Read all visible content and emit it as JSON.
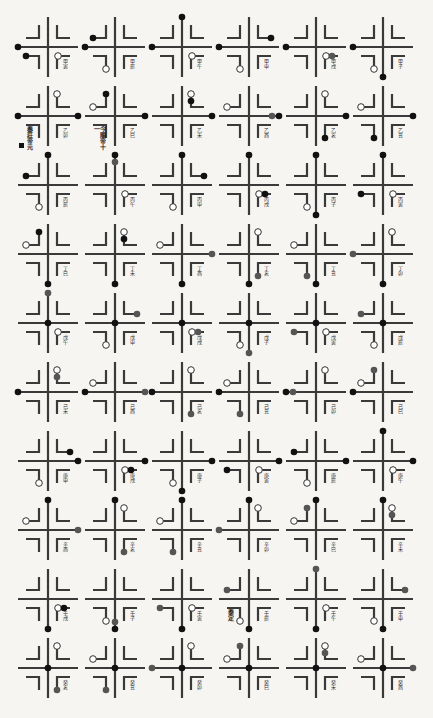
{
  "diagram": {
    "type": "yin-yang cross-and-bracket divination chart",
    "rows": 10,
    "cols": 6,
    "origin": {
      "x": 48,
      "y": 47
    },
    "pitch": {
      "x": 67,
      "y": 69
    },
    "colors": {
      "background": "#f6f5f1",
      "line": "#3a3a3a",
      "dot_filled": "#111111",
      "dot_gray": "#555555",
      "dot_open_fill": "#ffffff",
      "dot_open_stroke": "#333333"
    },
    "legend": {
      "dot_types": {
        "f": "filled black",
        "g": "filled gray",
        "o": "open circle"
      },
      "positions": [
        "N",
        "S",
        "E",
        "W",
        "C",
        "NWh",
        "NWv",
        "NEh",
        "NEv",
        "SWh",
        "SWv",
        "SEh",
        "SEv"
      ]
    },
    "cells": [
      {
        "r": 0,
        "c": 0,
        "label": "甲寅",
        "dots": [
          {
            "p": "W",
            "t": "f"
          },
          {
            "p": "SWh",
            "t": "f"
          },
          {
            "p": "SEh",
            "t": "o"
          }
        ]
      },
      {
        "r": 0,
        "c": 1,
        "label": "甲辰",
        "dots": [
          {
            "p": "W",
            "t": "f"
          },
          {
            "p": "NWh",
            "t": "f"
          },
          {
            "p": "SWv",
            "t": "o"
          }
        ]
      },
      {
        "r": 0,
        "c": 2,
        "label": "甲午",
        "dots": [
          {
            "p": "N",
            "t": "f"
          },
          {
            "p": "W",
            "t": "f"
          },
          {
            "p": "SEh",
            "t": "o"
          }
        ]
      },
      {
        "r": 0,
        "c": 3,
        "label": "甲申",
        "dots": [
          {
            "p": "W",
            "t": "f"
          },
          {
            "p": "NEh",
            "t": "f"
          },
          {
            "p": "SWv",
            "t": "o"
          }
        ]
      },
      {
        "r": 0,
        "c": 4,
        "label": "甲戌",
        "dots": [
          {
            "p": "W",
            "t": "f"
          },
          {
            "p": "SEh",
            "t": "o"
          },
          {
            "p": "SEh2",
            "t": "g"
          }
        ]
      },
      {
        "r": 0,
        "c": 5,
        "label": "甲子",
        "dots": [
          {
            "p": "W",
            "t": "f"
          },
          {
            "p": "S",
            "t": "f"
          },
          {
            "p": "SWv",
            "t": "o"
          }
        ]
      },
      {
        "r": 1,
        "c": 0,
        "label": "乙卯",
        "dots": [
          {
            "p": "W",
            "t": "f"
          },
          {
            "p": "E",
            "t": "f"
          },
          {
            "p": "NEv",
            "t": "o"
          }
        ],
        "note": "秦莊帝元",
        "note_mark": true
      },
      {
        "r": 1,
        "c": 1,
        "label": "乙巳",
        "dots": [
          {
            "p": "E",
            "t": "f"
          },
          {
            "p": "NWh",
            "t": "o"
          },
          {
            "p": "NWv",
            "t": "f"
          }
        ],
        "note": "今順帝十一"
      },
      {
        "r": 1,
        "c": 2,
        "label": "乙未",
        "dots": [
          {
            "p": "E",
            "t": "f"
          },
          {
            "p": "NEv",
            "t": "o"
          },
          {
            "p": "NEv2",
            "t": "f"
          }
        ]
      },
      {
        "r": 1,
        "c": 3,
        "label": "乙酉",
        "dots": [
          {
            "p": "E",
            "t": "f"
          },
          {
            "p": "E2",
            "t": "g"
          },
          {
            "p": "NWh",
            "t": "o"
          }
        ]
      },
      {
        "r": 1,
        "c": 4,
        "label": "乙亥",
        "dots": [
          {
            "p": "E",
            "t": "f"
          },
          {
            "p": "NEv",
            "t": "o"
          },
          {
            "p": "SEv",
            "t": "f"
          }
        ]
      },
      {
        "r": 1,
        "c": 5,
        "label": "乙丑",
        "dots": [
          {
            "p": "E",
            "t": "f"
          },
          {
            "p": "NWh",
            "t": "o"
          },
          {
            "p": "SWv",
            "t": "f"
          }
        ]
      },
      {
        "r": 2,
        "c": 0,
        "label": "丙辰",
        "dots": [
          {
            "p": "N",
            "t": "f"
          },
          {
            "p": "NWh",
            "t": "f"
          },
          {
            "p": "SWv",
            "t": "o"
          }
        ]
      },
      {
        "r": 2,
        "c": 1,
        "label": "丙午",
        "dots": [
          {
            "p": "N",
            "t": "f"
          },
          {
            "p": "N2",
            "t": "g"
          },
          {
            "p": "SEh",
            "t": "o"
          }
        ]
      },
      {
        "r": 2,
        "c": 2,
        "label": "丙申",
        "dots": [
          {
            "p": "N",
            "t": "f"
          },
          {
            "p": "NEh",
            "t": "f"
          },
          {
            "p": "SWv",
            "t": "o"
          }
        ]
      },
      {
        "r": 2,
        "c": 3,
        "label": "丙戌",
        "dots": [
          {
            "p": "N",
            "t": "f"
          },
          {
            "p": "SEh",
            "t": "o"
          },
          {
            "p": "SEh2",
            "t": "f"
          }
        ]
      },
      {
        "r": 2,
        "c": 4,
        "label": "丙子",
        "dots": [
          {
            "p": "N",
            "t": "f"
          },
          {
            "p": "S",
            "t": "f"
          },
          {
            "p": "SWv",
            "t": "o"
          }
        ]
      },
      {
        "r": 2,
        "c": 5,
        "label": "丙寅",
        "dots": [
          {
            "p": "N",
            "t": "f"
          },
          {
            "p": "SWh",
            "t": "f"
          },
          {
            "p": "SEh",
            "t": "o"
          }
        ]
      },
      {
        "r": 3,
        "c": 0,
        "label": "丁巳",
        "dots": [
          {
            "p": "S",
            "t": "f"
          },
          {
            "p": "NWh",
            "t": "o"
          },
          {
            "p": "NWv",
            "t": "f"
          }
        ]
      },
      {
        "r": 3,
        "c": 1,
        "label": "丁未",
        "dots": [
          {
            "p": "S",
            "t": "f"
          },
          {
            "p": "NEv",
            "t": "o"
          },
          {
            "p": "NEv2",
            "t": "f"
          }
        ]
      },
      {
        "r": 3,
        "c": 2,
        "label": "丁酉",
        "dots": [
          {
            "p": "S",
            "t": "f"
          },
          {
            "p": "E",
            "t": "g"
          },
          {
            "p": "NWh",
            "t": "o"
          }
        ]
      },
      {
        "r": 3,
        "c": 3,
        "label": "丁亥",
        "dots": [
          {
            "p": "S",
            "t": "f"
          },
          {
            "p": "NEv",
            "t": "o"
          },
          {
            "p": "SEv",
            "t": "g"
          }
        ]
      },
      {
        "r": 3,
        "c": 4,
        "label": "丁丑",
        "dots": [
          {
            "p": "S",
            "t": "f"
          },
          {
            "p": "NWh",
            "t": "o"
          },
          {
            "p": "SWv",
            "t": "g"
          }
        ]
      },
      {
        "r": 3,
        "c": 5,
        "label": "丁卯",
        "dots": [
          {
            "p": "S",
            "t": "f"
          },
          {
            "p": "W",
            "t": "g"
          },
          {
            "p": "NEv",
            "t": "o"
          }
        ]
      },
      {
        "r": 4,
        "c": 0,
        "label": "戊午",
        "dots": [
          {
            "p": "C",
            "t": "f"
          },
          {
            "p": "N",
            "t": "g"
          },
          {
            "p": "SEh",
            "t": "o"
          }
        ]
      },
      {
        "r": 4,
        "c": 1,
        "label": "戊申",
        "dots": [
          {
            "p": "C",
            "t": "f"
          },
          {
            "p": "NEh",
            "t": "g"
          },
          {
            "p": "SWv",
            "t": "o"
          }
        ]
      },
      {
        "r": 4,
        "c": 2,
        "label": "戊戌",
        "dots": [
          {
            "p": "C",
            "t": "f"
          },
          {
            "p": "SEh",
            "t": "o"
          },
          {
            "p": "SEh2",
            "t": "g"
          }
        ]
      },
      {
        "r": 4,
        "c": 3,
        "label": "戊子",
        "dots": [
          {
            "p": "C",
            "t": "f"
          },
          {
            "p": "S",
            "t": "g"
          },
          {
            "p": "SWv",
            "t": "o"
          }
        ]
      },
      {
        "r": 4,
        "c": 4,
        "label": "戊寅",
        "dots": [
          {
            "p": "C",
            "t": "f"
          },
          {
            "p": "SWh",
            "t": "g"
          },
          {
            "p": "SEh",
            "t": "o"
          }
        ]
      },
      {
        "r": 4,
        "c": 5,
        "label": "戊辰",
        "dots": [
          {
            "p": "C",
            "t": "f"
          },
          {
            "p": "NWh",
            "t": "g"
          },
          {
            "p": "SWv",
            "t": "o"
          }
        ]
      },
      {
        "r": 5,
        "c": 0,
        "label": "己未",
        "dots": [
          {
            "p": "W",
            "t": "f"
          },
          {
            "p": "NEv",
            "t": "o"
          },
          {
            "p": "NEv2",
            "t": "g"
          }
        ]
      },
      {
        "r": 5,
        "c": 1,
        "label": "己酉",
        "dots": [
          {
            "p": "W",
            "t": "f"
          },
          {
            "p": "E",
            "t": "g"
          },
          {
            "p": "NWh",
            "t": "o"
          }
        ]
      },
      {
        "r": 5,
        "c": 2,
        "label": "己亥",
        "dots": [
          {
            "p": "W",
            "t": "f"
          },
          {
            "p": "NEv",
            "t": "o"
          },
          {
            "p": "SEv",
            "t": "g"
          }
        ]
      },
      {
        "r": 5,
        "c": 3,
        "label": "己丑",
        "dots": [
          {
            "p": "W",
            "t": "f"
          },
          {
            "p": "NWh",
            "t": "o"
          },
          {
            "p": "SWv",
            "t": "g"
          }
        ]
      },
      {
        "r": 5,
        "c": 4,
        "label": "己卯",
        "dots": [
          {
            "p": "W",
            "t": "f"
          },
          {
            "p": "W2",
            "t": "g"
          },
          {
            "p": "NEv",
            "t": "o"
          }
        ]
      },
      {
        "r": 5,
        "c": 5,
        "label": "己巳",
        "dots": [
          {
            "p": "W",
            "t": "f"
          },
          {
            "p": "NWh",
            "t": "o"
          },
          {
            "p": "NWv",
            "t": "g"
          }
        ]
      },
      {
        "r": 6,
        "c": 0,
        "label": "庚申",
        "dots": [
          {
            "p": "E",
            "t": "f"
          },
          {
            "p": "NEh",
            "t": "f"
          },
          {
            "p": "SWv",
            "t": "o"
          }
        ]
      },
      {
        "r": 6,
        "c": 1,
        "label": "庚戌",
        "dots": [
          {
            "p": "E",
            "t": "f"
          },
          {
            "p": "SEh",
            "t": "o"
          },
          {
            "p": "SEh2",
            "t": "f"
          }
        ]
      },
      {
        "r": 6,
        "c": 2,
        "label": "庚子",
        "dots": [
          {
            "p": "E",
            "t": "f"
          },
          {
            "p": "S",
            "t": "f"
          },
          {
            "p": "SWv",
            "t": "o"
          }
        ]
      },
      {
        "r": 6,
        "c": 3,
        "label": "庚寅",
        "dots": [
          {
            "p": "E",
            "t": "f"
          },
          {
            "p": "SWh",
            "t": "f"
          },
          {
            "p": "SEh",
            "t": "o"
          }
        ]
      },
      {
        "r": 6,
        "c": 4,
        "label": "庚辰",
        "dots": [
          {
            "p": "E",
            "t": "f"
          },
          {
            "p": "NWh",
            "t": "f"
          },
          {
            "p": "SWv",
            "t": "o"
          }
        ]
      },
      {
        "r": 6,
        "c": 5,
        "label": "庚午",
        "dots": [
          {
            "p": "E",
            "t": "f"
          },
          {
            "p": "N",
            "t": "f"
          },
          {
            "p": "SEh",
            "t": "o"
          }
        ]
      },
      {
        "r": 7,
        "c": 0,
        "label": "辛酉",
        "dots": [
          {
            "p": "N",
            "t": "f"
          },
          {
            "p": "E",
            "t": "g"
          },
          {
            "p": "NWh",
            "t": "o"
          }
        ]
      },
      {
        "r": 7,
        "c": 1,
        "label": "辛亥",
        "dots": [
          {
            "p": "N",
            "t": "f"
          },
          {
            "p": "NEv",
            "t": "o"
          },
          {
            "p": "SEv",
            "t": "g"
          }
        ]
      },
      {
        "r": 7,
        "c": 2,
        "label": "辛丑",
        "dots": [
          {
            "p": "N",
            "t": "f"
          },
          {
            "p": "NWh",
            "t": "o"
          },
          {
            "p": "SWv",
            "t": "g"
          }
        ]
      },
      {
        "r": 7,
        "c": 3,
        "label": "辛卯",
        "dots": [
          {
            "p": "N",
            "t": "f"
          },
          {
            "p": "W",
            "t": "g"
          },
          {
            "p": "NEv",
            "t": "o"
          }
        ]
      },
      {
        "r": 7,
        "c": 4,
        "label": "辛巳",
        "dots": [
          {
            "p": "N",
            "t": "f"
          },
          {
            "p": "NWh",
            "t": "o"
          },
          {
            "p": "NWv",
            "t": "g"
          }
        ]
      },
      {
        "r": 7,
        "c": 5,
        "label": "辛未",
        "dots": [
          {
            "p": "N",
            "t": "f"
          },
          {
            "p": "NEv",
            "t": "o"
          },
          {
            "p": "NEv2",
            "t": "g"
          }
        ]
      },
      {
        "r": 8,
        "c": 0,
        "label": "壬戌",
        "dots": [
          {
            "p": "S",
            "t": "f"
          },
          {
            "p": "SEh",
            "t": "o"
          },
          {
            "p": "SEh2",
            "t": "f"
          }
        ]
      },
      {
        "r": 8,
        "c": 1,
        "label": "壬子",
        "dots": [
          {
            "p": "S",
            "t": "f"
          },
          {
            "p": "S2",
            "t": "g"
          },
          {
            "p": "SWv",
            "t": "o"
          }
        ]
      },
      {
        "r": 8,
        "c": 2,
        "label": "壬寅",
        "dots": [
          {
            "p": "S",
            "t": "f"
          },
          {
            "p": "SWh",
            "t": "g"
          },
          {
            "p": "SEh",
            "t": "o"
          }
        ]
      },
      {
        "r": 8,
        "c": 3,
        "label": "壬辰",
        "dots": [
          {
            "p": "S",
            "t": "f"
          },
          {
            "p": "NWh",
            "t": "g"
          },
          {
            "p": "SWv",
            "t": "o"
          }
        ],
        "note": "泰定"
      },
      {
        "r": 8,
        "c": 4,
        "label": "壬午",
        "dots": [
          {
            "p": "S",
            "t": "f"
          },
          {
            "p": "N",
            "t": "g"
          },
          {
            "p": "SEh",
            "t": "o"
          }
        ]
      },
      {
        "r": 8,
        "c": 5,
        "label": "壬申",
        "dots": [
          {
            "p": "S",
            "t": "f"
          },
          {
            "p": "NEh",
            "t": "g"
          },
          {
            "p": "SWv",
            "t": "o"
          }
        ]
      },
      {
        "r": 9,
        "c": 0,
        "label": "癸亥",
        "dots": [
          {
            "p": "C",
            "t": "f"
          },
          {
            "p": "NEv",
            "t": "o"
          },
          {
            "p": "SEv",
            "t": "g"
          }
        ]
      },
      {
        "r": 9,
        "c": 1,
        "label": "癸丑",
        "dots": [
          {
            "p": "C",
            "t": "f"
          },
          {
            "p": "NWh",
            "t": "o"
          },
          {
            "p": "SWv",
            "t": "g"
          }
        ]
      },
      {
        "r": 9,
        "c": 2,
        "label": "癸卯",
        "dots": [
          {
            "p": "C",
            "t": "f"
          },
          {
            "p": "W",
            "t": "g"
          },
          {
            "p": "NEv",
            "t": "o"
          }
        ]
      },
      {
        "r": 9,
        "c": 3,
        "label": "癸巳",
        "dots": [
          {
            "p": "C",
            "t": "f"
          },
          {
            "p": "NWh",
            "t": "o"
          },
          {
            "p": "NWv",
            "t": "g"
          }
        ]
      },
      {
        "r": 9,
        "c": 4,
        "label": "癸未",
        "dots": [
          {
            "p": "C",
            "t": "f"
          },
          {
            "p": "NEv",
            "t": "o"
          },
          {
            "p": "NEv2",
            "t": "g"
          }
        ]
      },
      {
        "r": 9,
        "c": 5,
        "label": "癸酉",
        "dots": [
          {
            "p": "C",
            "t": "f"
          },
          {
            "p": "E",
            "t": "g"
          },
          {
            "p": "NWh",
            "t": "o"
          }
        ]
      }
    ]
  }
}
